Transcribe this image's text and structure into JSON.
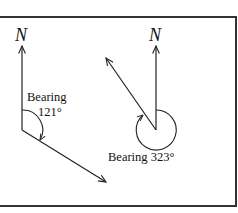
{
  "diagram": {
    "frame": {
      "stroke": "#333333"
    },
    "left": {
      "north_label": "N",
      "bearing_label": "Bearing",
      "bearing_value": "121°"
    },
    "right": {
      "north_label": "N",
      "bearing_text": "Bearing 323°"
    }
  }
}
